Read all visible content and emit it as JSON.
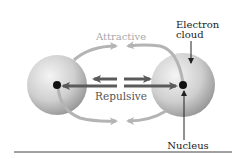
{
  "diagram": {
    "labels": {
      "attractive": "Attractive",
      "repulsive": "Repulsive",
      "electron_cloud_line1": "Electron",
      "electron_cloud_line2": "cloud",
      "nucleus": "Nucleus"
    },
    "colors": {
      "attractive_arrow": "#b4b4b4",
      "repulsive_arrow": "#5a5a5a",
      "nucleus": "#111111",
      "sphere_light": "#f2f2f2",
      "sphere_dark": "#8c8c8c",
      "baseline": "#444444"
    },
    "atoms": [
      {
        "name": "left-atom"
      },
      {
        "name": "right-atom"
      }
    ]
  }
}
